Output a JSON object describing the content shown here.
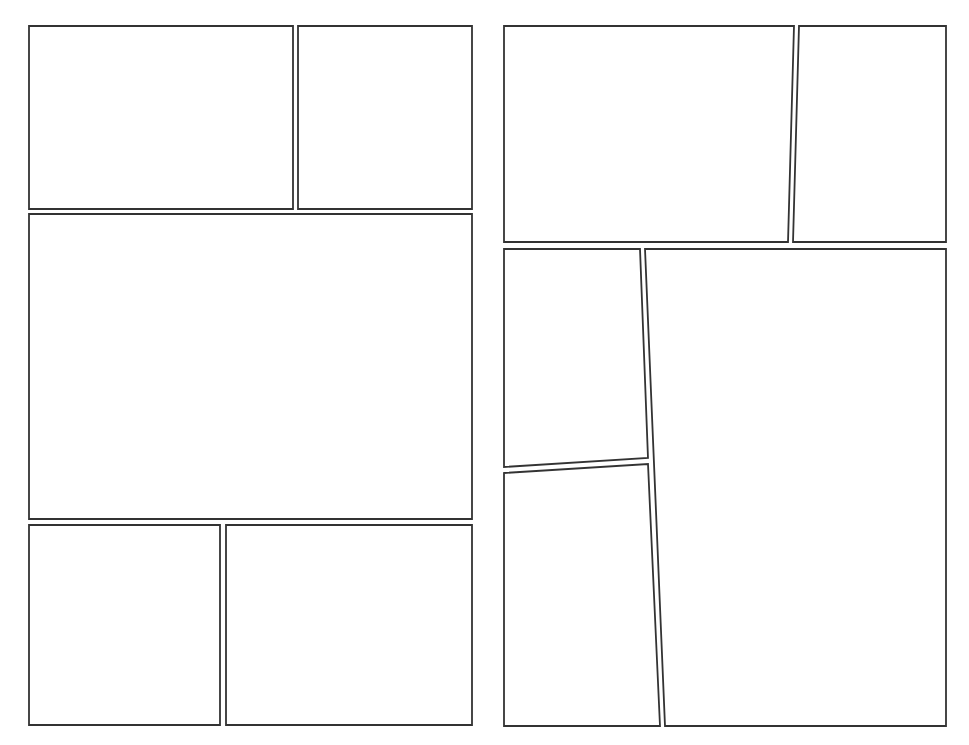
{
  "document": {
    "type": "comic-panel-template",
    "background": "#ffffff",
    "border_color": "#333333"
  },
  "pages": [
    {
      "name": "left-page",
      "panels": [
        {
          "id": "L1",
          "points": "29,26 293,26 293,209 29,209"
        },
        {
          "id": "L2",
          "points": "298,26 472,26 472,209 298,209"
        },
        {
          "id": "L3",
          "points": "29,214 472,214 472,519 29,519"
        },
        {
          "id": "L4",
          "points": "29,525 220,525 220,725 29,725"
        },
        {
          "id": "L5",
          "points": "226,525 472,525 472,725 226,725"
        }
      ]
    },
    {
      "name": "right-page",
      "panels": [
        {
          "id": "R1",
          "points": "504,26 794,26 788,242 504,242"
        },
        {
          "id": "R2",
          "points": "799,26 946,26 946,242 793,242"
        },
        {
          "id": "R3",
          "points": "504,249 640,249 648,458 504,467"
        },
        {
          "id": "R4",
          "points": "504,473 648,464 660,726 504,726"
        },
        {
          "id": "R5",
          "points": "645,249 946,249 946,726 665,726"
        }
      ]
    }
  ]
}
